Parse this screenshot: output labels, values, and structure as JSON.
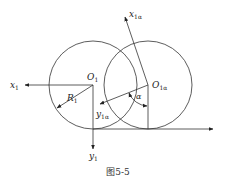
{
  "diagram": {
    "caption": "图5-5",
    "labels": {
      "o1": {
        "main": "O",
        "sub": "1"
      },
      "o1a": {
        "main": "O",
        "sub": "1α"
      },
      "x1": {
        "main": "x",
        "sub": "1"
      },
      "y1": {
        "main": "y",
        "sub": "1"
      },
      "x1a": {
        "main": "x",
        "sub": "1α"
      },
      "y1a": {
        "main": "y",
        "sub": "1α"
      },
      "r1": {
        "main": "R",
        "sub": "1"
      },
      "alpha": "α"
    },
    "stroke_color": "#333333"
  }
}
